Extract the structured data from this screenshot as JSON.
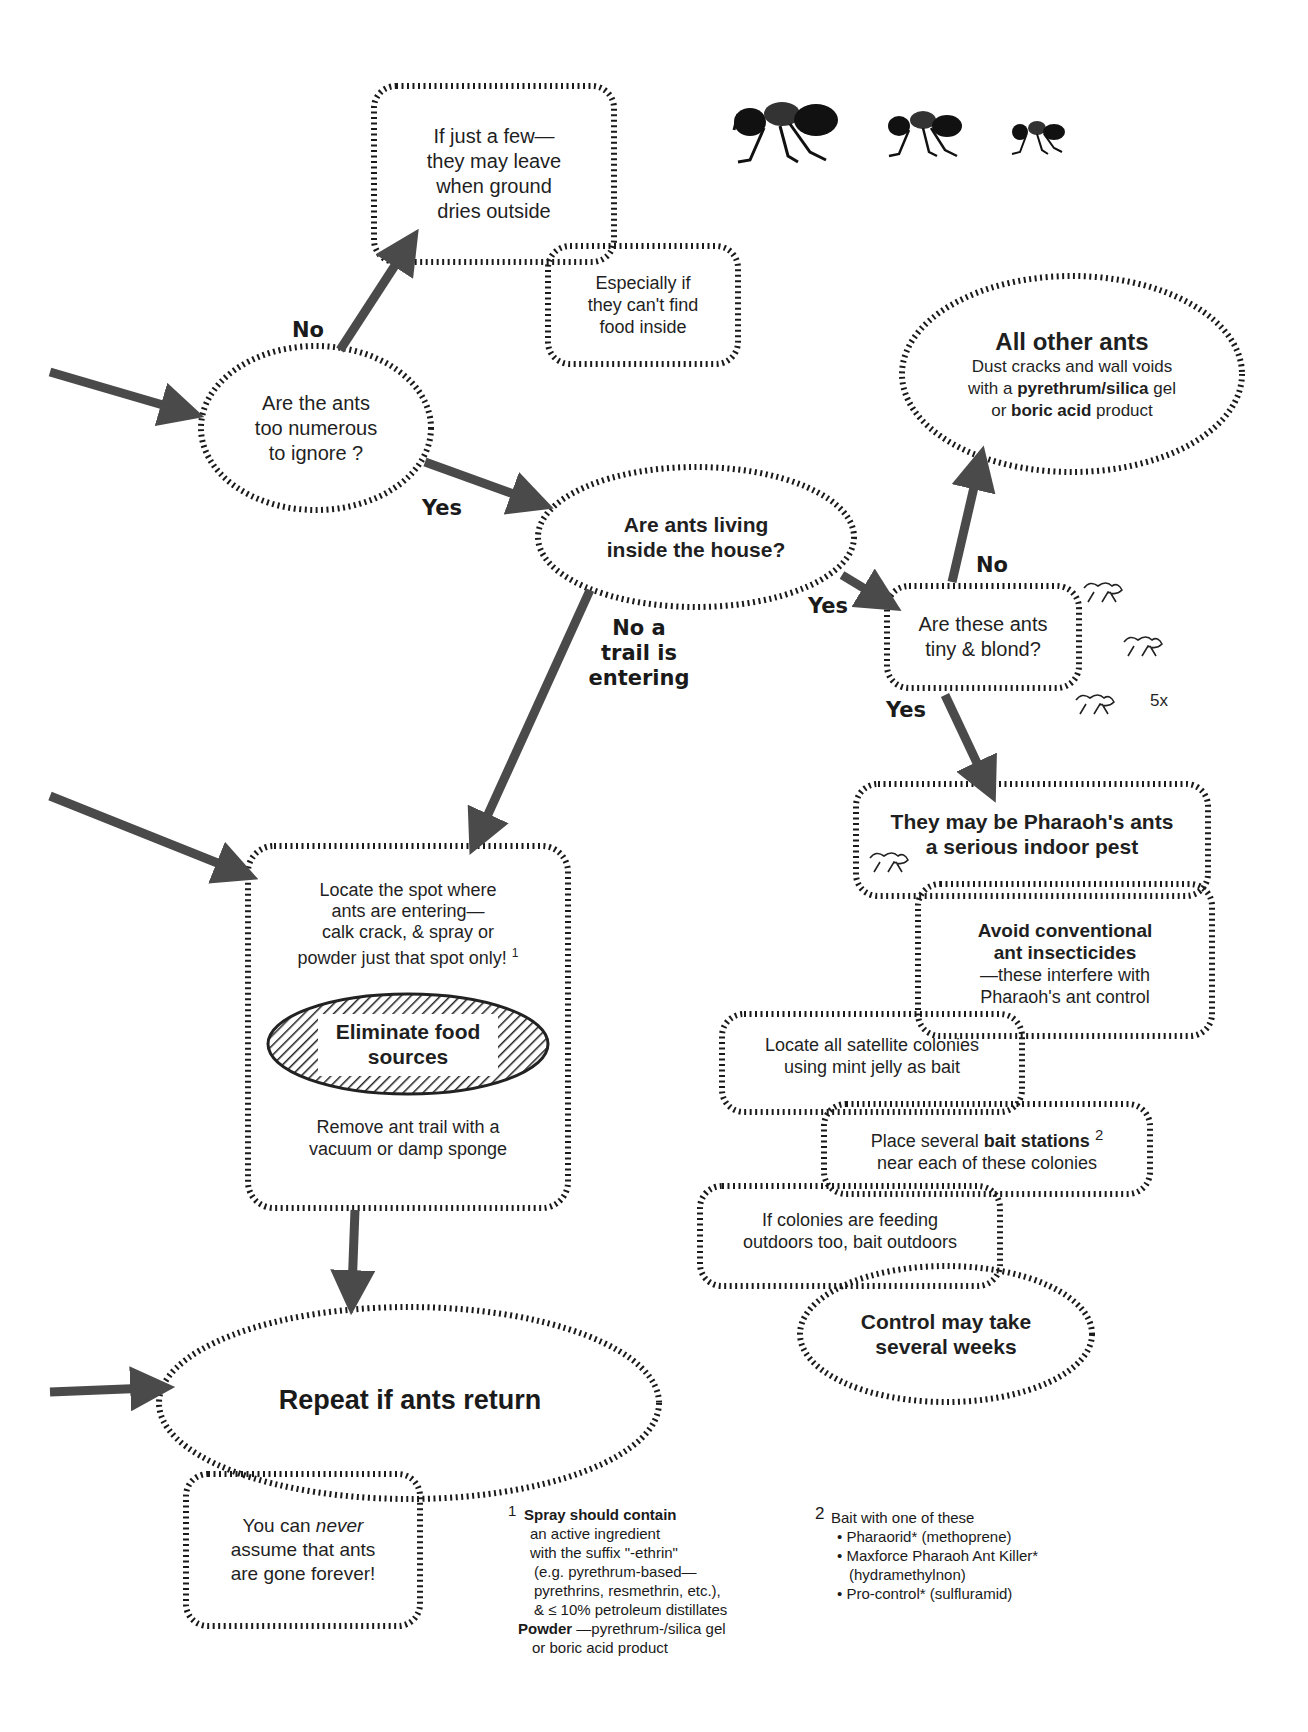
{
  "diagram": {
    "colors": {
      "arrow": "#4a4a4a",
      "hatch": "#1a1a1a",
      "background": "#ffffff"
    }
  },
  "nodes": {
    "few": {
      "lines": [
        "If just a few—",
        "they may leave",
        "when ground",
        "dries outside"
      ]
    },
    "food_inside": {
      "lines": [
        "Especially if",
        "they can't find",
        "food inside"
      ]
    },
    "numerous": {
      "lines": [
        "Are the ants",
        "too numerous",
        "to ignore ?"
      ]
    },
    "living_inside": {
      "lines": [
        "Are ants living",
        "inside the house?"
      ]
    },
    "other_ants": {
      "title": "All other ants",
      "line1": "Dust cracks and wall voids",
      "line2_pre": "with a ",
      "line2_bold": "pyrethrum/silica",
      "line2_post": " gel",
      "line3_pre": "or ",
      "line3_bold": "boric acid",
      "line3_post": " product"
    },
    "tiny_blond": {
      "lines": [
        "Are these ants",
        "tiny & blond?"
      ]
    },
    "magnification": "5x",
    "pharaoh": {
      "lines": [
        "They may be Pharaoh's ants",
        "a serious indoor pest"
      ]
    },
    "avoid": {
      "bold1": "Avoid conventional",
      "bold2": "ant insecticides",
      "line3": "—these interfere with",
      "line4": "Pharaoh's ant control"
    },
    "satellite": {
      "lines": [
        "Locate all satellite colonies",
        "using mint jelly as bait"
      ]
    },
    "bait_stations": {
      "pre": "Place several ",
      "bold": "bait stations",
      "sup": "2",
      "line2": "near each of these colonies"
    },
    "outdoors": {
      "lines": [
        "If colonies are feeding",
        "outdoors too, bait outdoors"
      ]
    },
    "weeks": {
      "lines": [
        "Control may take",
        "several weeks"
      ]
    },
    "locate_spot": {
      "lines": [
        "Locate the spot where",
        "ants are entering—",
        "calk crack, & spray or",
        "powder just that spot only!"
      ],
      "sup": "1"
    },
    "eliminate": {
      "lines": [
        "Eliminate food",
        "sources"
      ]
    },
    "remove_trail": {
      "lines": [
        "Remove ant trail with a",
        "vacuum or damp sponge"
      ]
    },
    "repeat": {
      "text": "Repeat if ants return"
    },
    "never": {
      "pre": "You can ",
      "em": "never",
      "line2": "assume that ants",
      "line3": "are gone forever!"
    }
  },
  "edge_labels": {
    "no_numerous": "No",
    "yes_numerous": "Yes",
    "no_trail": [
      "No a",
      "trail is",
      "entering"
    ],
    "yes_living": "Yes",
    "no_tiny": "No",
    "yes_tiny": "Yes"
  },
  "footnotes": {
    "one": {
      "marker": "1",
      "title": "Spray should contain",
      "lines": [
        "an active ingredient",
        "with the suffix \"-ethrin\"",
        "(e.g. pyrethrum-based—",
        "pyrethrins, resmethrin, etc.),",
        "& ≤ 10% petroleum distillates"
      ],
      "powder_label": "Powder",
      "powder_text": " —pyrethrum-/silica gel",
      "last_line": "or  boric acid product"
    },
    "two": {
      "marker": "2",
      "title": "Bait with one of these",
      "items": [
        "• Pharaorid* (methoprene)",
        "• Maxforce Pharaoh Ant Killer*",
        "(hydramethylnon)",
        "• Pro-control* (sulfluramid)"
      ]
    }
  }
}
